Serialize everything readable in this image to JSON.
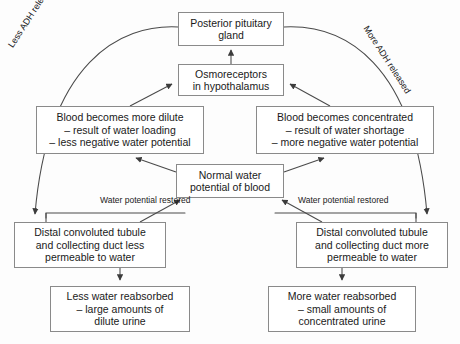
{
  "diagram": {
    "stroke_color": "#4a4a4a",
    "box_border_color": "#8a8a8a",
    "background_color": "#fdfdfd",
    "text_color": "#1a1a1a",
    "nodes": {
      "pituitary": {
        "lines": [
          "Posterior pituitary",
          "gland"
        ]
      },
      "osmoreceptors": {
        "lines": [
          "Osmoreceptors",
          "in hypothalamus"
        ]
      },
      "blood_dilute": {
        "lines": [
          "Blood becomes more dilute",
          "– result of water loading",
          "– less negative water potential"
        ]
      },
      "blood_concentrated": {
        "lines": [
          "Blood becomes concentrated",
          "– result of water shortage",
          "– more negative water potential"
        ]
      },
      "normal": {
        "lines": [
          "Normal water",
          "potential of blood"
        ]
      },
      "dct_less": {
        "lines": [
          "Distal convoluted tubule",
          "and collecting duct less",
          "permeable to water"
        ]
      },
      "dct_more": {
        "lines": [
          "Distal convoluted tubule",
          "and collecting duct more",
          "permeable to water"
        ]
      },
      "less_water": {
        "lines": [
          "Less water reabsorbed",
          "– large amounts of",
          "dilute urine"
        ]
      },
      "more_water": {
        "lines": [
          "More water reabsorbed",
          "– small amounts of",
          "concentrated urine"
        ]
      }
    },
    "edge_labels": {
      "less_adh": "Less ADH released",
      "more_adh": "More ADH released",
      "water_potential_restored_left": [
        "Water potential",
        "restored"
      ],
      "water_potential_restored_right": [
        "Water potential",
        "restored"
      ]
    }
  }
}
